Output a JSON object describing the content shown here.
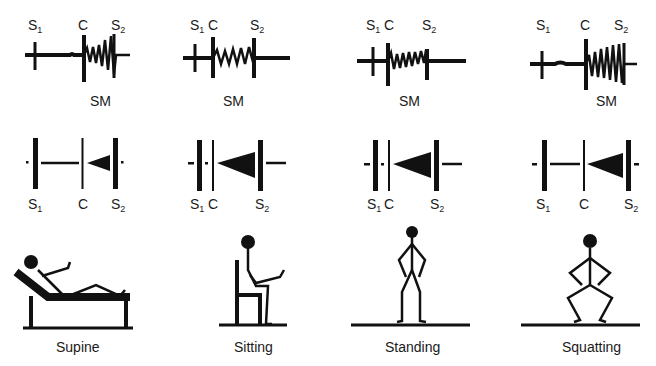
{
  "figure": {
    "panels": [
      {
        "id": "supine",
        "position_label": "Supine",
        "waveform": {
          "s1_label": "S",
          "s1_sub": "1",
          "c_label": "C",
          "s2_label": "S",
          "s2_sub": "2",
          "murmur_label": "SM"
        },
        "diagram": {
          "s1_label": "S",
          "s1_sub": "1",
          "c_label": "C",
          "s2_label": "S",
          "s2_sub": "2"
        }
      },
      {
        "id": "sitting",
        "position_label": "Sitting",
        "waveform": {
          "s1_label": "S",
          "s1_sub": "1",
          "c_label": "C",
          "s2_label": "S",
          "s2_sub": "2",
          "murmur_label": "SM"
        },
        "diagram": {
          "s1_label": "S",
          "s1_sub": "1",
          "c_label": "C",
          "s2_label": "S",
          "s2_sub": "2"
        }
      },
      {
        "id": "standing",
        "position_label": "Standing",
        "waveform": {
          "s1_label": "S",
          "s1_sub": "1",
          "c_label": "C",
          "s2_label": "S",
          "s2_sub": "2",
          "murmur_label": "SM"
        },
        "diagram": {
          "s1_label": "S",
          "s1_sub": "1",
          "c_label": "C",
          "s2_label": "S",
          "s2_sub": "2"
        }
      },
      {
        "id": "squatting",
        "position_label": "Squatting",
        "waveform": {
          "s1_label": "S",
          "s1_sub": "1",
          "c_label": "C",
          "s2_label": "S",
          "s2_sub": "2",
          "murmur_label": "SM"
        },
        "diagram": {
          "s1_label": "S",
          "s1_sub": "1",
          "c_label": "C",
          "s2_label": "S",
          "s2_sub": "2"
        }
      }
    ],
    "colors": {
      "ink": "#111111",
      "background": "#ffffff"
    }
  }
}
